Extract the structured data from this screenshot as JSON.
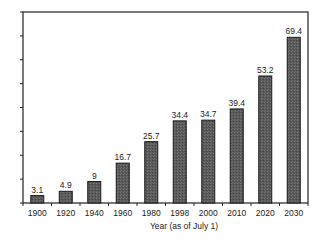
{
  "chart_data": {
    "type": "bar",
    "title": "",
    "xlabel": "Year (as of July 1)",
    "ylabel": "",
    "categories": [
      "1900",
      "1920",
      "1940",
      "1960",
      "1980",
      "1998",
      "2000",
      "2010",
      "2020",
      "2030"
    ],
    "values": [
      3.1,
      4.9,
      9,
      16.7,
      25.7,
      34.4,
      34.7,
      39.4,
      53.2,
      69.4
    ],
    "data_labels": [
      "3.1",
      "4.9",
      "9",
      "16.7",
      "25.7",
      "34.4",
      "34.7",
      "39.4",
      "53.2",
      "69.4"
    ],
    "ylim": [
      0,
      80
    ],
    "y_ticks": [
      0,
      10,
      20,
      30,
      40,
      50,
      60,
      70,
      80
    ],
    "y_tick_labels_shown": false,
    "grid": false,
    "legend": null,
    "bar_color": "#555555"
  }
}
